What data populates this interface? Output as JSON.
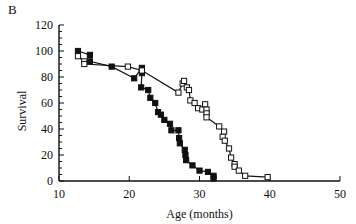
{
  "panel_label": "B",
  "chart_data": {
    "type": "line",
    "title": "",
    "xlabel": "Age (months)",
    "ylabel": "Survival",
    "xlim": [
      10,
      50
    ],
    "ylim": [
      0,
      120
    ],
    "xticks": [
      10,
      20,
      30,
      40,
      50
    ],
    "yticks": [
      0,
      20,
      40,
      60,
      80,
      100,
      120
    ],
    "grid": false,
    "legend": null,
    "series": [
      {
        "name": "filled squares",
        "marker": "filled-square",
        "color": "#111111",
        "points": [
          [
            12.7,
            100
          ],
          [
            14.4,
            97
          ],
          [
            14.4,
            92
          ],
          [
            17.5,
            88
          ],
          [
            20.7,
            79
          ],
          [
            21.8,
            87
          ],
          [
            21.8,
            83
          ],
          [
            21.7,
            72
          ],
          [
            22.7,
            70
          ],
          [
            23.0,
            64
          ],
          [
            23.7,
            60
          ],
          [
            24.1,
            53
          ],
          [
            24.5,
            51
          ],
          [
            25.0,
            47
          ],
          [
            25.8,
            44
          ],
          [
            26.0,
            39
          ],
          [
            27.0,
            39
          ],
          [
            27.1,
            33
          ],
          [
            27.2,
            29
          ],
          [
            27.9,
            24
          ],
          [
            28.0,
            20
          ],
          [
            28.1,
            16
          ],
          [
            29.0,
            12
          ],
          [
            30.0,
            8
          ],
          [
            31.2,
            7
          ],
          [
            32.0,
            4
          ],
          [
            32.0,
            2
          ]
        ]
      },
      {
        "name": "open squares",
        "marker": "open-square",
        "color": "#111111",
        "points": [
          [
            12.7,
            96
          ],
          [
            13.6,
            92
          ],
          [
            13.6,
            90
          ],
          [
            19.8,
            88
          ],
          [
            21.8,
            85
          ],
          [
            27.0,
            68
          ],
          [
            27.6,
            75
          ],
          [
            27.8,
            77
          ],
          [
            28.2,
            72
          ],
          [
            28.5,
            70
          ],
          [
            28.7,
            62
          ],
          [
            29.3,
            60
          ],
          [
            29.8,
            56
          ],
          [
            30.4,
            55
          ],
          [
            30.8,
            59
          ],
          [
            31.0,
            55
          ],
          [
            31.0,
            52
          ],
          [
            31.0,
            49
          ],
          [
            32.8,
            42
          ],
          [
            33.5,
            38
          ],
          [
            33.3,
            34
          ],
          [
            33.6,
            31
          ],
          [
            34.2,
            25
          ],
          [
            34.5,
            18
          ],
          [
            35.0,
            13
          ],
          [
            35.0,
            11
          ],
          [
            35.6,
            8
          ],
          [
            36.5,
            4
          ],
          [
            39.7,
            3
          ]
        ]
      }
    ]
  }
}
